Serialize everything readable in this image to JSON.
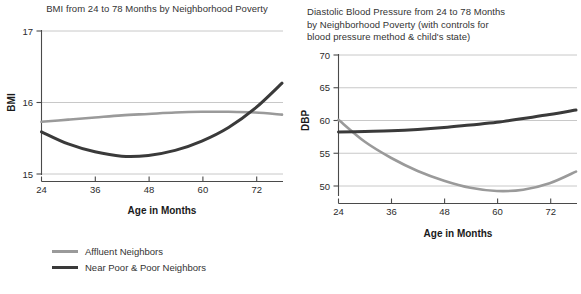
{
  "colors": {
    "affluent": "#9a9a9a",
    "near_poor": "#3a3a3a",
    "grid": "#c2c2c2",
    "axis": "#4a4a4a",
    "text": "#2b2b2b"
  },
  "legend_labels": {
    "affluent": "Affluent Neighbors",
    "near_poor": "Near Poor & Poor Neighbors"
  },
  "chart_data": [
    {
      "id": "bmi",
      "type": "line",
      "title": "BMI from 24 to 78 Months by Neighborhood Poverty",
      "xlabel": "Age in Months",
      "ylabel": "BMI",
      "xlim": [
        24,
        78
      ],
      "ylim": [
        15,
        17
      ],
      "xticks": [
        24,
        36,
        48,
        60,
        72
      ],
      "yticks": [
        15,
        16,
        17
      ],
      "grid": true,
      "legend_position": "below",
      "x": [
        24,
        30,
        36,
        42,
        48,
        54,
        60,
        66,
        72,
        78
      ],
      "series": [
        {
          "name": "Affluent Neighbors",
          "color": "#9a9a9a",
          "values": [
            15.73,
            15.76,
            15.79,
            15.82,
            15.84,
            15.86,
            15.87,
            15.87,
            15.86,
            15.83
          ]
        },
        {
          "name": "Near Poor & Poor Neighbors",
          "color": "#3a3a3a",
          "values": [
            15.59,
            15.42,
            15.31,
            15.25,
            15.26,
            15.33,
            15.46,
            15.65,
            15.92,
            16.27
          ]
        }
      ]
    },
    {
      "id": "dbp",
      "type": "line",
      "title": "Diastolic Blood Pressure from 24 to 78 Months by Neighborhood Poverty (with controls for blood pressure method & child's state)",
      "title_lines": [
        "Diastolic Blood Pressure from 24 to 78 Months",
        "by Neighborhood Poverty (with controls for",
        "blood pressure method & child's state)"
      ],
      "xlabel": "Age in Months",
      "ylabel": "DBP",
      "xlim": [
        24,
        78
      ],
      "ylim": [
        48.5,
        70
      ],
      "xticks": [
        24,
        36,
        48,
        60,
        72
      ],
      "yticks": [
        50,
        55,
        60,
        65,
        70
      ],
      "grid": true,
      "legend_position": "below",
      "x": [
        24,
        30,
        36,
        42,
        48,
        54,
        60,
        66,
        72,
        78
      ],
      "series": [
        {
          "name": "Affluent Neighbors",
          "color": "#9a9a9a",
          "values": [
            60.0,
            56.6,
            54.1,
            52.1,
            50.6,
            49.5,
            49.0,
            49.2,
            50.2,
            52.0
          ]
        },
        {
          "name": "Near Poor & Poor Neighbors",
          "color": "#3a3a3a",
          "values": [
            58.1,
            58.2,
            58.3,
            58.5,
            58.8,
            59.2,
            59.6,
            60.2,
            60.8,
            61.5
          ]
        }
      ]
    }
  ]
}
